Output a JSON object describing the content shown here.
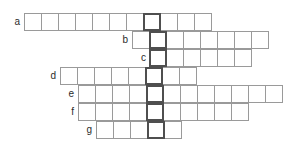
{
  "puzzle": {
    "type": "crossword-word-grid",
    "title": "",
    "rows": [
      {
        "label": "a",
        "cells_before_key": 7,
        "cells_after_key": 3,
        "total_cells": 11,
        "key_index": 7,
        "letters": []
      },
      {
        "label": "b",
        "cells_before_key": 1,
        "cells_after_key": 6,
        "total_cells": 8,
        "key_index": 1,
        "letters": []
      },
      {
        "label": "c",
        "cells_before_key": 0,
        "cells_after_key": 5,
        "total_cells": 6,
        "key_index": 0,
        "letters": []
      },
      {
        "label": "d",
        "cells_before_key": 5,
        "cells_after_key": 2,
        "total_cells": 8,
        "key_index": 5,
        "letters": []
      },
      {
        "label": "e",
        "cells_before_key": 4,
        "cells_after_key": 7,
        "total_cells": 12,
        "key_index": 4,
        "letters": []
      },
      {
        "label": "f",
        "cells_before_key": 4,
        "cells_after_key": 5,
        "total_cells": 10,
        "key_index": 4,
        "letters": []
      },
      {
        "label": "g",
        "cells_before_key": 3,
        "cells_after_key": 1,
        "total_cells": 5,
        "key_index": 3,
        "letters": []
      }
    ],
    "key_column": {
      "name": "highlighted-answer-column",
      "cell_count": 7,
      "border_color": "#4f4f4f"
    },
    "geometry": {
      "cell_size": 18,
      "key_column_left": 150,
      "grid_top": 13,
      "label_gap": 4
    },
    "colors": {
      "cell_border": "#9a9a9a",
      "key_border": "#4f4f4f",
      "cell_fill": "#ffffff",
      "label_text": "#2b2b2b",
      "background": "#ffffff"
    }
  }
}
